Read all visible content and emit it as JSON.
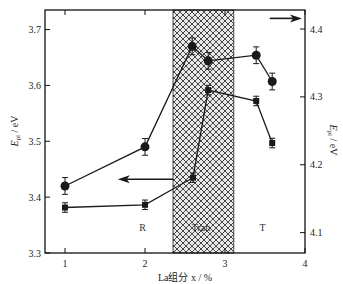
{
  "chart_data": {
    "type": "line",
    "title": "",
    "xlabel": "La组分 x / %",
    "ylabel_left": "E_pl / eV",
    "ylabel_right": "E_pl / eV",
    "xlim": [
      0.75,
      4
    ],
    "ylim_left": [
      3.3,
      3.735
    ],
    "ylim_right": [
      4.07,
      4.428
    ],
    "xticks": [
      1,
      2,
      3,
      4
    ],
    "yticks_left": [
      3.3,
      3.4,
      3.5,
      3.6,
      3.7
    ],
    "yticks_right": [
      4.1,
      4.2,
      4.3,
      4.4
    ],
    "grid": false,
    "series": [
      {
        "name": "circles",
        "marker": "circle",
        "axis": "left",
        "x": [
          1,
          2,
          2.59,
          2.79,
          3.39,
          3.59
        ],
        "y": [
          3.42,
          3.49,
          3.67,
          3.644,
          3.654,
          3.607
        ],
        "err": [
          0.015,
          0.015,
          0.015,
          0.015,
          0.015,
          0.015
        ]
      },
      {
        "name": "squares",
        "marker": "square",
        "axis": "right",
        "x": [
          1,
          2,
          2.6,
          2.79,
          3.39,
          3.59
        ],
        "y": [
          4.137,
          4.141,
          4.181,
          4.31,
          4.294,
          4.232
        ],
        "err": [
          0.007,
          0.007,
          0.007,
          0.007,
          0.007,
          0.007
        ]
      }
    ],
    "shaded_region": {
      "x_start": 2.35,
      "x_end": 3.11,
      "pattern": "crosshatch",
      "label": "Tran"
    },
    "region_labels": [
      {
        "text": "R",
        "x": 1.97,
        "y_left": 3.34
      },
      {
        "text": "Tran",
        "x": 2.7,
        "y_left": 3.34
      },
      {
        "text": "T",
        "x": 3.47,
        "y_left": 3.34
      }
    ],
    "annotations": [
      {
        "type": "arrow",
        "direction": "left",
        "points_to_axis": "left",
        "x_from": 2.35,
        "x_to": 1.66,
        "y_left": 3.432
      },
      {
        "type": "arrow",
        "direction": "right",
        "points_to_axis": "right",
        "x_from": 3.56,
        "x_to": 4.0,
        "y_left": 3.72
      }
    ],
    "colors": {
      "line": "#1a1a1a",
      "hatch": "#333333",
      "background": "#ffffff"
    }
  }
}
